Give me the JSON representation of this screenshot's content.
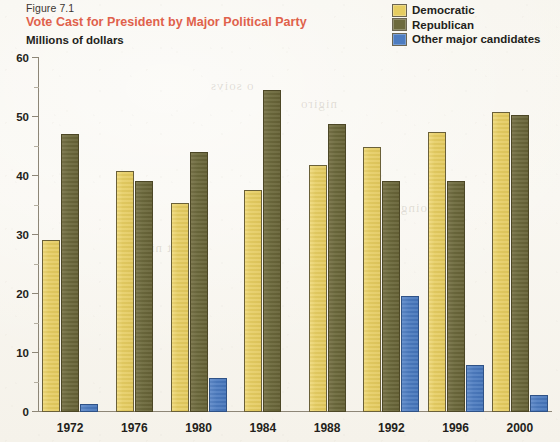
{
  "header": {
    "figure_label": "Figure 7.1",
    "title": "Vote Cast for President by Major Political Party",
    "axis_caption": "Millions of dollars"
  },
  "legend": {
    "items": [
      {
        "label": "Democratic",
        "color": "#e6cd62",
        "key": "democratic"
      },
      {
        "label": "Republican",
        "color": "#6d6a3d",
        "key": "republican"
      },
      {
        "label": "Other major candidates",
        "color": "#4d7cc0",
        "key": "other"
      }
    ]
  },
  "colors": {
    "democratic": "#e6cd62",
    "republican": "#6d6a3d",
    "other": "#4d7cc0",
    "title": "#e0614b",
    "axis": "#8d8677",
    "background": "#f7f5ee",
    "text": "#241f1b"
  },
  "axis": {
    "y_ticks": [
      0,
      10,
      20,
      30,
      40,
      50,
      60
    ],
    "y_minor_ticks": [
      5,
      15,
      25,
      35,
      45,
      55
    ],
    "y_min": 0,
    "y_max": 60
  },
  "chart_data": {
    "type": "bar",
    "title": "Vote Cast for President by Major Political Party",
    "subtitle": "Figure 7.1",
    "xlabel": "",
    "ylabel": "Millions of dollars",
    "ylim": [
      0,
      60
    ],
    "grid": false,
    "legend_position": "top-right",
    "categories": [
      "1972",
      "1976",
      "1980",
      "1984",
      "1988",
      "1992",
      "1996",
      "2000"
    ],
    "series": [
      {
        "name": "Democratic",
        "color": "#e6cd62",
        "values": [
          29.2,
          40.8,
          35.5,
          37.6,
          41.8,
          44.9,
          47.4,
          50.9
        ]
      },
      {
        "name": "Republican",
        "color": "#6d6a3d",
        "values": [
          47.2,
          39.1,
          44.0,
          54.5,
          48.9,
          39.1,
          39.2,
          50.4
        ]
      },
      {
        "name": "Other major candidates",
        "color": "#4d7cc0",
        "values": [
          1.4,
          0,
          5.7,
          0,
          0,
          19.7,
          8.0,
          2.8
        ]
      }
    ]
  }
}
